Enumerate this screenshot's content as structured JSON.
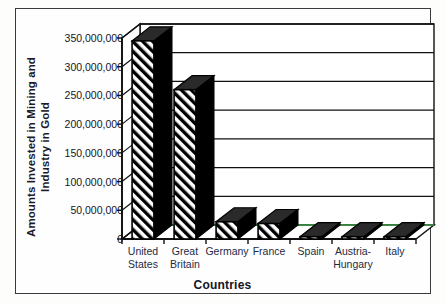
{
  "chart_data": {
    "type": "bar",
    "title": "",
    "xlabel": "Countries",
    "ylabel": "Amounts Invested in Mining and Industry in Gold",
    "ylabel_line1": "Amounts Invested in Mining and",
    "ylabel_line2": "Industry in Gold",
    "categories": [
      "United States",
      "Great Britain",
      "Germany",
      "France",
      "Spain",
      "Austria-Hungary",
      "Italy"
    ],
    "category_lines": [
      [
        "United",
        "States"
      ],
      [
        "Great",
        "Britain"
      ],
      [
        "Germany",
        ""
      ],
      [
        "France",
        ""
      ],
      [
        "Spain",
        ""
      ],
      [
        "Austria-",
        "Hungary"
      ],
      [
        "Italy",
        ""
      ]
    ],
    "values": [
      345000000,
      260000000,
      30000000,
      27000000,
      4000000,
      4000000,
      4000000
    ],
    "ylim": [
      0,
      350000000
    ],
    "ytick_values": [
      0,
      50000000,
      100000000,
      150000000,
      200000000,
      250000000,
      300000000,
      350000000
    ],
    "ytick_labels": [
      "0",
      "50,000,000",
      "100,000,000",
      "150,000,000",
      "200,000,000",
      "250,000,000",
      "300,000,000",
      "350,000,000"
    ],
    "grid": true,
    "legend": "none",
    "style": "3d-column-hatched",
    "colors": {
      "bar_fill": "#ffffff",
      "bar_hatch": "#000000",
      "bar_side": "#000000",
      "axis": "#111111",
      "gridline": "#111111",
      "floor_back_edge": "#3f9f4a",
      "xtick_text": "#1d2b44",
      "ytick_text": "#15151f",
      "frame_border": "#3a3a3a",
      "plot_background": "#ffffff"
    }
  }
}
